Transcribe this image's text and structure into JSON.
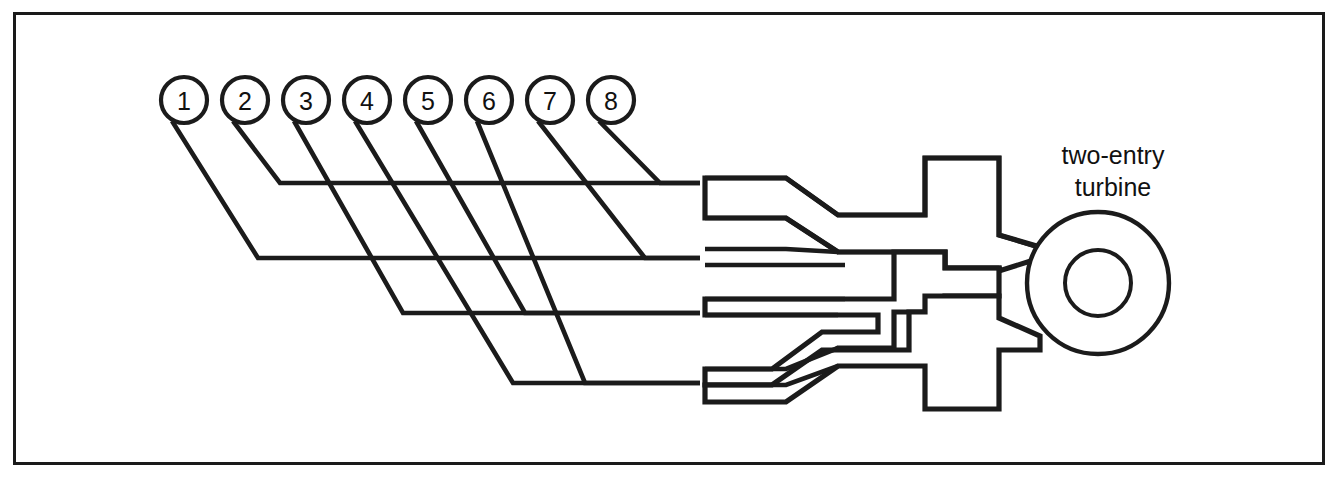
{
  "figure": {
    "kind": "engineering-schematic",
    "background_color": "#ffffff",
    "line_color": "#1b1b1b",
    "frame": {
      "x": 13,
      "y": 12,
      "width": 1309,
      "height": 450,
      "stroke": "#1a1a1a",
      "stroke_width": 3
    }
  },
  "cylinders": {
    "count": 8,
    "radius": 23,
    "center_y": 100,
    "first_center_x": 184,
    "spacing": 61,
    "items": [
      {
        "label": "1",
        "cx": 184,
        "cy": 100
      },
      {
        "label": "2",
        "cx": 245,
        "cy": 100
      },
      {
        "label": "3",
        "cx": 306,
        "cy": 100
      },
      {
        "label": "4",
        "cx": 367,
        "cy": 100
      },
      {
        "label": "5",
        "cx": 428,
        "cy": 100
      },
      {
        "label": "6",
        "cx": 489,
        "cy": 100
      },
      {
        "label": "7",
        "cx": 550,
        "cy": 100
      },
      {
        "label": "8",
        "cx": 611,
        "cy": 100
      }
    ]
  },
  "manifold_rows": {
    "row_y": [
      183,
      258,
      313,
      383
    ],
    "right_end_x": 700,
    "description": "four collector runners feeding two turbine entries"
  },
  "runners": [
    {
      "cylinder": "1",
      "row": 2,
      "path": "M 172 121 L 258 258 L 700 258"
    },
    {
      "cylinder": "2",
      "row": 1,
      "path": "M 233 121 L 280 183 L 700 183"
    },
    {
      "cylinder": "3",
      "row": 3,
      "path": "M 294 121 L 403 313 L 700 313"
    },
    {
      "cylinder": "4",
      "row": 4,
      "path": "M 355 121 L 513 383 L 700 383"
    },
    {
      "cylinder": "5",
      "row": 3,
      "path": "M 416 121 L 525 313 L 700 313"
    },
    {
      "cylinder": "6",
      "row": 4,
      "path": "M 477 121 L 585 383 L 700 383"
    },
    {
      "cylinder": "7",
      "row": 2,
      "path": "M 538 121 L 645 258 L 700 258"
    },
    {
      "cylinder": "8",
      "row": 1,
      "path": "M 599 121 L 660 183 L 700 183"
    }
  ],
  "entries": {
    "upper": {
      "name": "upper-turbine-entry",
      "pipe_pairs": [
        {
          "y_top": 178,
          "y_bottom": 194
        },
        {
          "y_top": 249,
          "y_bottom": 265
        }
      ]
    },
    "lower": {
      "name": "lower-turbine-entry",
      "pipe_pairs": [
        {
          "y_top": 299,
          "y_bottom": 315
        },
        {
          "y_top": 369,
          "y_bottom": 385
        }
      ]
    }
  },
  "duct_geometry": {
    "upper_outline": "M 705 178 L 786 178 L 836 214 L 928 214 L 928 159 L 1000 159 L 1000 234 L 1038 234 L 1038 246 L 1000 260 L 1000 270 L 944 270 L 944 254 L 928 254 L 928 296 L 1000 296 L 1000 318 L 1042 334 L 1038 352 L 1000 352 L 1000 410 L 928 410 L 928 366 L 836 366 L 786 402 L 705 402 L 705 385 L 772 385 L 819 350 L 900 350 L 900 303 L 716 303 L 716 299 L 900 299 L 900 252 L 819 252 L 772 218 L 705 218",
    "note": "single continuous silhouette of both scroll volutes and entry blocks"
  },
  "turbine": {
    "outer_circle": {
      "cx": 1098,
      "cy": 283,
      "r": 71
    },
    "inner_circle": {
      "cx": 1098,
      "cy": 283,
      "r": 33
    },
    "label_line_1": "two-entry",
    "label_line_2": "turbine",
    "label_x": 1113,
    "label_y_1": 155,
    "label_y_2": 187
  }
}
